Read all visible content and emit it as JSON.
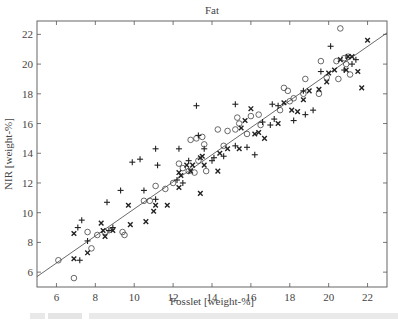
{
  "chart_data": {
    "type": "scatter",
    "title": "Fat",
    "xlabel": "Fosslet [weight-%]",
    "ylabel": "NIR [weight-%]",
    "xlim": [
      5,
      23
    ],
    "ylim": [
      5,
      22.9
    ],
    "xticks": [
      6,
      8,
      10,
      12,
      14,
      16,
      18,
      20,
      22
    ],
    "yticks": [
      6,
      8,
      10,
      12,
      14,
      16,
      18,
      20,
      22
    ],
    "grid": false,
    "legend": null,
    "fit_line": {
      "x": [
        5,
        23
      ],
      "y": [
        5.7,
        22.1
      ]
    },
    "series": [
      {
        "name": "circle",
        "marker": "o",
        "points": [
          [
            6.1,
            6.8
          ],
          [
            6.9,
            5.6
          ],
          [
            7.6,
            8.7
          ],
          [
            7.8,
            7.6
          ],
          [
            8.1,
            8.5
          ],
          [
            8.5,
            8.7
          ],
          [
            9.4,
            8.7
          ],
          [
            9.5,
            8.5
          ],
          [
            10.5,
            10.8
          ],
          [
            10.8,
            10.8
          ],
          [
            11.1,
            11.8
          ],
          [
            11.6,
            11.6
          ],
          [
            12.0,
            12.0
          ],
          [
            12.3,
            13.3
          ],
          [
            12.5,
            13.0
          ],
          [
            12.8,
            12.8
          ],
          [
            13.1,
            12.7
          ],
          [
            13.3,
            13.5
          ],
          [
            13.2,
            15.0
          ],
          [
            13.5,
            15.1
          ],
          [
            13.6,
            14.6
          ],
          [
            12.9,
            14.9
          ],
          [
            14.3,
            15.6
          ],
          [
            14.8,
            15.5
          ],
          [
            15.2,
            15.6
          ],
          [
            15.4,
            16.0
          ],
          [
            15.3,
            16.4
          ],
          [
            16.0,
            16.5
          ],
          [
            16.4,
            16.6
          ],
          [
            16.5,
            15.9
          ],
          [
            15.8,
            15.3
          ],
          [
            14.6,
            14.5
          ],
          [
            17.5,
            16.9
          ],
          [
            18.0,
            17.5
          ],
          [
            18.7,
            18.0
          ],
          [
            18.2,
            17.7
          ],
          [
            18.8,
            19.0
          ],
          [
            19.6,
            20.2
          ],
          [
            19.9,
            19.1
          ],
          [
            20.5,
            19.0
          ],
          [
            19.5,
            18.0
          ],
          [
            20.6,
            22.4
          ],
          [
            20.8,
            20.4
          ],
          [
            21.0,
            20.5
          ],
          [
            20.4,
            20.2
          ],
          [
            21.1,
            19.3
          ],
          [
            20.9,
            20.0
          ],
          [
            17.9,
            18.2
          ],
          [
            17.7,
            18.4
          ],
          [
            13.7,
            12.8
          ]
        ]
      },
      {
        "name": "plus",
        "marker": "+",
        "points": [
          [
            7.2,
            6.8
          ],
          [
            7.6,
            8.1
          ],
          [
            7.3,
            9.5
          ],
          [
            8.7,
            8.8
          ],
          [
            8.9,
            9.0
          ],
          [
            9.3,
            11.5
          ],
          [
            10.5,
            11.5
          ],
          [
            11.1,
            10.9
          ],
          [
            11.2,
            13.2
          ],
          [
            12.2,
            12.2
          ],
          [
            12.5,
            12.0
          ],
          [
            12.8,
            13.5
          ],
          [
            12.3,
            14.3
          ],
          [
            13.2,
            17.2
          ],
          [
            13.3,
            15.2
          ],
          [
            13.6,
            14.3
          ],
          [
            14.0,
            13.5
          ],
          [
            14.1,
            13.7
          ],
          [
            14.6,
            13.8
          ],
          [
            15.2,
            14.5
          ],
          [
            15.8,
            14.4
          ],
          [
            16.2,
            13.9
          ],
          [
            15.2,
            17.3
          ],
          [
            16.6,
            16.1
          ],
          [
            17.1,
            17.3
          ],
          [
            17.4,
            17.2
          ],
          [
            17.0,
            15.9
          ],
          [
            18.7,
            18.2
          ],
          [
            19.6,
            19.5
          ],
          [
            20.1,
            21.2
          ],
          [
            20.8,
            19.6
          ],
          [
            21.2,
            20.0
          ],
          [
            21.4,
            20.3
          ],
          [
            19.2,
            16.9
          ],
          [
            18.8,
            16.6
          ],
          [
            17.2,
            16.3
          ],
          [
            18.2,
            16.2
          ],
          [
            11.1,
            14.3
          ],
          [
            9.9,
            13.4
          ],
          [
            10.3,
            13.6
          ],
          [
            8.6,
            10.7
          ],
          [
            7.1,
            9.0
          ]
        ]
      },
      {
        "name": "cross",
        "marker": "x",
        "points": [
          [
            6.9,
            8.6
          ],
          [
            6.9,
            6.9
          ],
          [
            7.6,
            7.3
          ],
          [
            8.3,
            9.3
          ],
          [
            8.4,
            8.8
          ],
          [
            8.5,
            8.4
          ],
          [
            8.9,
            8.8
          ],
          [
            9.7,
            10.5
          ],
          [
            9.8,
            9.2
          ],
          [
            10.6,
            9.4
          ],
          [
            11.0,
            10.1
          ],
          [
            11.1,
            10.5
          ],
          [
            11.7,
            10.5
          ],
          [
            12.3,
            12.7
          ],
          [
            12.3,
            11.7
          ],
          [
            12.4,
            12.5
          ],
          [
            12.7,
            13.2
          ],
          [
            13.0,
            13.2
          ],
          [
            12.9,
            12.8
          ],
          [
            13.4,
            11.3
          ],
          [
            13.4,
            13.7
          ],
          [
            13.5,
            13.8
          ],
          [
            14.3,
            12.8
          ],
          [
            14.4,
            14.0
          ],
          [
            14.8,
            14.3
          ],
          [
            15.5,
            15.7
          ],
          [
            15.7,
            16.2
          ],
          [
            16.0,
            17.0
          ],
          [
            16.2,
            15.3
          ],
          [
            16.4,
            15.4
          ],
          [
            16.7,
            15.0
          ],
          [
            17.4,
            16.0
          ],
          [
            17.7,
            17.4
          ],
          [
            18.1,
            16.9
          ],
          [
            18.4,
            16.8
          ],
          [
            18.7,
            17.6
          ],
          [
            19.0,
            18.2
          ],
          [
            19.5,
            18.3
          ],
          [
            19.9,
            18.8
          ],
          [
            20.3,
            19.6
          ],
          [
            20.6,
            20.3
          ],
          [
            20.9,
            19.6
          ],
          [
            21.5,
            19.5
          ],
          [
            21.7,
            18.4
          ],
          [
            22.0,
            21.6
          ],
          [
            21.2,
            20.5
          ],
          [
            21.0,
            20.5
          ],
          [
            20.0,
            19.4
          ],
          [
            13.6,
            13.2
          ],
          [
            15.4,
            14.3
          ]
        ]
      }
    ]
  },
  "caption_visible": false
}
